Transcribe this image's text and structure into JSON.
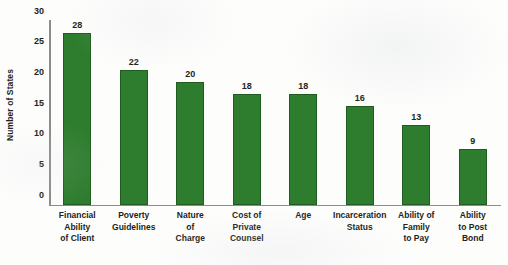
{
  "chart_data": {
    "type": "bar",
    "title": "",
    "subtitle": "",
    "xlabel": "",
    "ylabel": "Number of States",
    "ylim": [
      0,
      30
    ],
    "yticks": [
      0,
      5,
      10,
      15,
      20,
      25,
      30
    ],
    "ytick_labels": [
      "0",
      "5",
      "10",
      "15",
      "20",
      "25",
      "30"
    ],
    "grid": false,
    "legend": null,
    "bar_color": "#2e7d2e",
    "bar_edge_color": "#1f5c1f",
    "text_color": "#231f20",
    "axis_color": "#8c8c8c",
    "background": "#fdfdfc",
    "categories": [
      "Financial Ability of Client",
      "Poverty Guidelines",
      "Nature of Charge",
      "Cost of Private Counsel",
      "Age",
      "Incarceration Status",
      "Ability of Family to Pay",
      "Ability to Post Bond"
    ],
    "category_lines": [
      [
        "Financial",
        "Ability",
        "of Client"
      ],
      [
        "Poverty",
        "Guidelines"
      ],
      [
        "Nature",
        "of",
        "Charge"
      ],
      [
        "Cost of",
        "Private",
        "Counsel"
      ],
      [
        "Age"
      ],
      [
        "Incarceration",
        "Status"
      ],
      [
        "Ability of",
        "Family",
        "to Pay"
      ],
      [
        "Ability",
        "to Post",
        "Bond"
      ]
    ],
    "values": [
      28,
      22,
      20,
      18,
      18,
      16,
      13,
      9
    ],
    "value_labels": [
      "28",
      "22",
      "20",
      "18",
      "18",
      "16",
      "13",
      "9"
    ]
  }
}
